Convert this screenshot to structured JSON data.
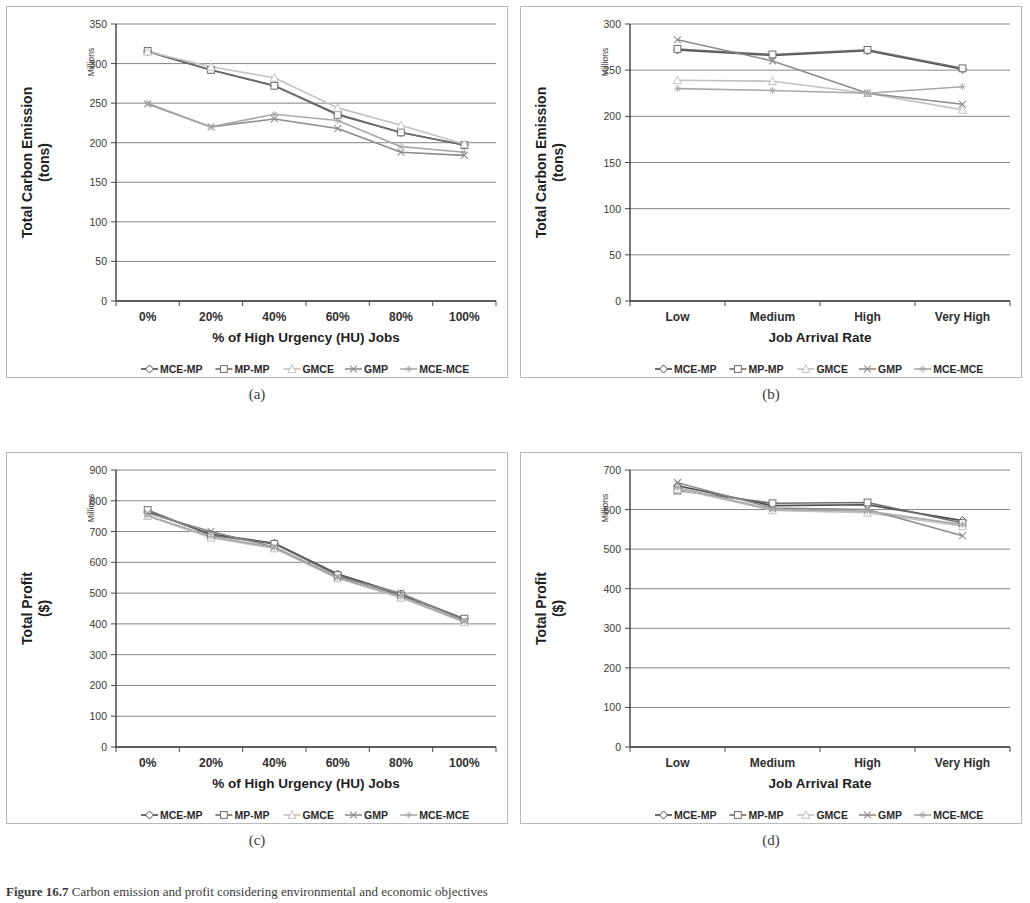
{
  "figure": {
    "caption_label": "Figure 16.7",
    "caption_text": "Carbon emission and profit considering environmental and economic objectives"
  },
  "panels": [
    {
      "id": "a",
      "caption": "(a)",
      "ylabel": "Total Carbon Emission\n(tons)",
      "ylabel_line1": "Total Carbon Emission",
      "ylabel_line2": "(tons)",
      "units_note": "Millions",
      "xlabel": "% of High Urgency (HU) Jobs",
      "yticks": [
        0,
        50,
        100,
        150,
        200,
        250,
        300,
        350
      ],
      "xticklabels": [
        "0%",
        "20%",
        "40%",
        "60%",
        "80%",
        "100%"
      ]
    },
    {
      "id": "b",
      "caption": "(b)",
      "ylabel_line1": "Total Carbon Emission",
      "ylabel_line2": "(tons)",
      "units_note": "Millions",
      "xlabel": "Job Arrival Rate",
      "yticks": [
        0,
        50,
        100,
        150,
        200,
        250,
        300
      ],
      "xticklabels": [
        "Low",
        "Medium",
        "High",
        "Very High"
      ]
    },
    {
      "id": "c",
      "caption": "(c)",
      "ylabel_line1": "Total Profit",
      "ylabel_line2": "($)",
      "units_note": "Millions",
      "xlabel": "% of High Urgency (HU) Jobs",
      "yticks": [
        0,
        100,
        200,
        300,
        400,
        500,
        600,
        700,
        800,
        900
      ],
      "xticklabels": [
        "0%",
        "20%",
        "40%",
        "60%",
        "80%",
        "100%"
      ]
    },
    {
      "id": "d",
      "caption": "(d)",
      "ylabel_line1": "Total Profit",
      "ylabel_line2": "($)",
      "units_note": "Millions",
      "xlabel": "Job Arrival Rate",
      "yticks": [
        0,
        100,
        200,
        300,
        400,
        500,
        600,
        700
      ],
      "xticklabels": [
        "Low",
        "Medium",
        "High",
        "Very High"
      ]
    }
  ],
  "legend": {
    "entries": [
      {
        "label": "MCE-MP",
        "color": "#4a4a4a",
        "marker": "diamond"
      },
      {
        "label": "MP-MP",
        "color": "#6e6e6e",
        "marker": "square"
      },
      {
        "label": "GMCE",
        "color": "#c2c2c2",
        "marker": "triangle"
      },
      {
        "label": "GMP",
        "color": "#8c8c8c",
        "marker": "cross"
      },
      {
        "label": "MCE-MCE",
        "color": "#a8a8a8",
        "marker": "star"
      }
    ]
  },
  "chart_data": [
    {
      "id": "a",
      "type": "line",
      "title": "",
      "xlabel": "% of High Urgency (HU) Jobs",
      "ylabel": "Total Carbon Emission (tons)",
      "yunit": "Millions",
      "categories": [
        "0%",
        "20%",
        "40%",
        "60%",
        "80%",
        "100%"
      ],
      "ylim": [
        0,
        350
      ],
      "ytick_step": 50,
      "grid": true,
      "legend_position": "bottom",
      "series": [
        {
          "name": "MCE-MP",
          "color": "#4a4a4a",
          "marker": "diamond",
          "values": [
            315,
            292,
            272,
            236,
            213,
            197
          ]
        },
        {
          "name": "MP-MP",
          "color": "#6e6e6e",
          "marker": "square",
          "values": [
            316,
            292,
            272,
            235,
            213,
            197
          ]
        },
        {
          "name": "GMCE",
          "color": "#c2c2c2",
          "marker": "triangle",
          "values": [
            315,
            296,
            282,
            244,
            222,
            198
          ]
        },
        {
          "name": "GMP",
          "color": "#8c8c8c",
          "marker": "cross",
          "values": [
            249,
            220,
            230,
            218,
            188,
            184
          ]
        },
        {
          "name": "MCE-MCE",
          "color": "#a8a8a8",
          "marker": "star",
          "values": [
            250,
            220,
            236,
            228,
            195,
            188
          ]
        }
      ]
    },
    {
      "id": "b",
      "type": "line",
      "title": "",
      "xlabel": "Job Arrival Rate",
      "ylabel": "Total Carbon Emission (tons)",
      "yunit": "Millions",
      "categories": [
        "Low",
        "Medium",
        "High",
        "Very High"
      ],
      "ylim": [
        0,
        300
      ],
      "ytick_step": 50,
      "grid": true,
      "legend_position": "bottom",
      "series": [
        {
          "name": "MCE-MP",
          "color": "#4a4a4a",
          "marker": "diamond",
          "values": [
            272,
            266,
            271,
            251
          ]
        },
        {
          "name": "MP-MP",
          "color": "#6e6e6e",
          "marker": "square",
          "values": [
            273,
            267,
            272,
            252
          ]
        },
        {
          "name": "GMCE",
          "color": "#c2c2c2",
          "marker": "triangle",
          "values": [
            239,
            238,
            225,
            207
          ]
        },
        {
          "name": "GMP",
          "color": "#8c8c8c",
          "marker": "cross",
          "values": [
            283,
            260,
            225,
            213
          ]
        },
        {
          "name": "MCE-MCE",
          "color": "#a8a8a8",
          "marker": "star",
          "values": [
            230,
            228,
            225,
            232
          ]
        }
      ]
    },
    {
      "id": "c",
      "type": "line",
      "title": "",
      "xlabel": "% of High Urgency (HU) Jobs",
      "ylabel": "Total Profit ($)",
      "yunit": "Millions",
      "categories": [
        "0%",
        "20%",
        "40%",
        "60%",
        "80%",
        "100%"
      ],
      "ylim": [
        0,
        900
      ],
      "ytick_step": 100,
      "grid": true,
      "legend_position": "bottom",
      "series": [
        {
          "name": "MCE-MP",
          "color": "#4a4a4a",
          "marker": "diamond",
          "values": [
            764,
            692,
            662,
            562,
            497,
            416
          ]
        },
        {
          "name": "MP-MP",
          "color": "#6e6e6e",
          "marker": "square",
          "values": [
            770,
            688,
            660,
            558,
            492,
            417
          ]
        },
        {
          "name": "GMCE",
          "color": "#c2c2c2",
          "marker": "triangle",
          "values": [
            750,
            680,
            645,
            548,
            485,
            405
          ]
        },
        {
          "name": "GMP",
          "color": "#8c8c8c",
          "marker": "cross",
          "values": [
            760,
            700,
            650,
            552,
            500,
            410
          ]
        },
        {
          "name": "MCE-MCE",
          "color": "#a8a8a8",
          "marker": "star",
          "values": [
            752,
            684,
            648,
            550,
            488,
            408
          ]
        }
      ]
    },
    {
      "id": "d",
      "type": "line",
      "title": "",
      "xlabel": "Job Arrival Rate",
      "ylabel": "Total Profit ($)",
      "yunit": "Millions",
      "categories": [
        "Low",
        "Medium",
        "High",
        "Very High"
      ],
      "ylim": [
        0,
        700
      ],
      "ytick_step": 100,
      "grid": true,
      "legend_position": "bottom",
      "series": [
        {
          "name": "MCE-MP",
          "color": "#4a4a4a",
          "marker": "diamond",
          "values": [
            660,
            610,
            612,
            572
          ]
        },
        {
          "name": "MP-MP",
          "color": "#6e6e6e",
          "marker": "square",
          "values": [
            648,
            616,
            618,
            566
          ]
        },
        {
          "name": "GMCE",
          "color": "#c2c2c2",
          "marker": "triangle",
          "values": [
            652,
            598,
            592,
            558
          ]
        },
        {
          "name": "GMP",
          "color": "#8c8c8c",
          "marker": "cross",
          "values": [
            668,
            604,
            600,
            534
          ]
        },
        {
          "name": "MCE-MCE",
          "color": "#a8a8a8",
          "marker": "star",
          "values": [
            656,
            600,
            596,
            562
          ]
        }
      ]
    }
  ]
}
